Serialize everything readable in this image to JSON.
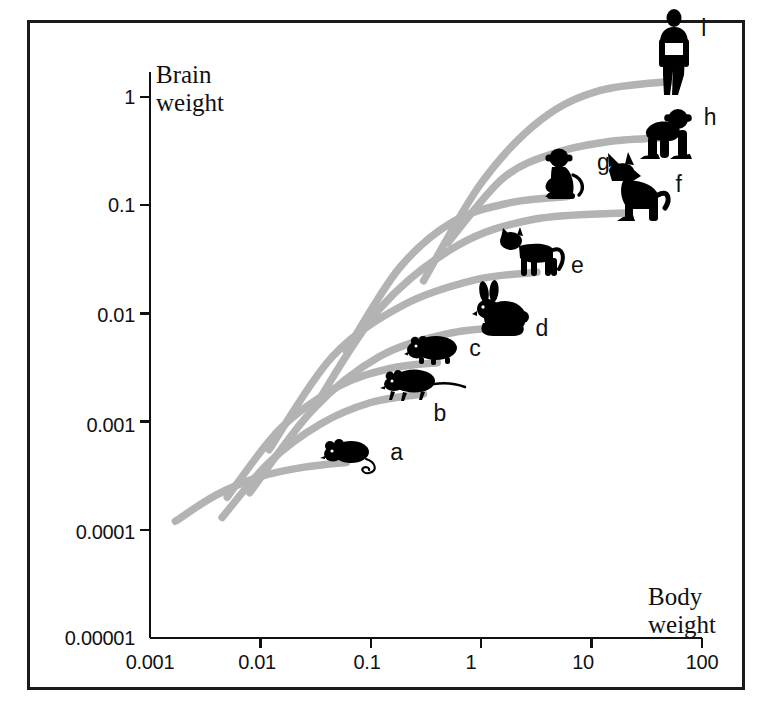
{
  "chart_data": {
    "type": "line",
    "title": "",
    "xlabel": "Body weight",
    "ylabel": "Brain weight",
    "xscale": "log",
    "yscale": "log",
    "xlim": [
      0.001,
      100
    ],
    "ylim": [
      1e-05,
      3
    ],
    "grid": false,
    "legend": "none",
    "xticks": [
      "0.001",
      "0.01",
      "0.1",
      "1",
      "10",
      "100"
    ],
    "yticks": [
      "0.00001",
      "0.0001",
      "0.001",
      "0.01",
      "0.1",
      "1"
    ],
    "annotation_note": "Each grey curve is an ontogenetic growth trajectory ending at the adult animal silhouette; labels a-i mark adult brain/body weight.",
    "series": [
      {
        "name": "a",
        "label": "a",
        "animal": "mouse",
        "adult_x": 0.06,
        "adult_y": 0.0004,
        "points": [
          {
            "x": 0.0017,
            "y": 0.00012
          },
          {
            "x": 0.004,
            "y": 0.00021
          },
          {
            "x": 0.01,
            "y": 0.00031
          },
          {
            "x": 0.025,
            "y": 0.00038
          },
          {
            "x": 0.06,
            "y": 0.00042
          }
        ]
      },
      {
        "name": "b",
        "label": "b",
        "animal": "rat",
        "adult_x": 0.3,
        "adult_y": 0.0018,
        "points": [
          {
            "x": 0.0045,
            "y": 0.00013
          },
          {
            "x": 0.012,
            "y": 0.00042
          },
          {
            "x": 0.035,
            "y": 0.00095
          },
          {
            "x": 0.1,
            "y": 0.0015
          },
          {
            "x": 0.3,
            "y": 0.0018
          }
        ]
      },
      {
        "name": "c",
        "label": "c",
        "animal": "guinea-pig",
        "adult_x": 0.4,
        "adult_y": 0.0035,
        "points": [
          {
            "x": 0.005,
            "y": 0.0002
          },
          {
            "x": 0.015,
            "y": 0.00085
          },
          {
            "x": 0.05,
            "y": 0.0021
          },
          {
            "x": 0.15,
            "y": 0.0031
          },
          {
            "x": 0.4,
            "y": 0.0035
          }
        ]
      },
      {
        "name": "d",
        "label": "d",
        "animal": "rabbit",
        "adult_x": 1.8,
        "adult_y": 0.0075,
        "points": [
          {
            "x": 0.008,
            "y": 0.00022
          },
          {
            "x": 0.03,
            "y": 0.0013
          },
          {
            "x": 0.12,
            "y": 0.004
          },
          {
            "x": 0.5,
            "y": 0.0065
          },
          {
            "x": 1.8,
            "y": 0.0075
          }
        ]
      },
      {
        "name": "e",
        "label": "e",
        "animal": "cat",
        "adult_x": 3.2,
        "adult_y": 0.024,
        "points": [
          {
            "x": 0.012,
            "y": 0.00055
          },
          {
            "x": 0.045,
            "y": 0.004
          },
          {
            "x": 0.2,
            "y": 0.012
          },
          {
            "x": 0.9,
            "y": 0.0205
          },
          {
            "x": 3.2,
            "y": 0.024
          }
        ]
      },
      {
        "name": "f",
        "label": "f",
        "animal": "dog",
        "adult_x": 22,
        "adult_y": 0.085,
        "points": [
          {
            "x": 0.03,
            "y": 0.0013
          },
          {
            "x": 0.12,
            "y": 0.011
          },
          {
            "x": 0.6,
            "y": 0.042
          },
          {
            "x": 3.0,
            "y": 0.074
          },
          {
            "x": 22.0,
            "y": 0.085
          }
        ]
      },
      {
        "name": "g",
        "label": "g",
        "animal": "monkey",
        "adult_x": 6.0,
        "adult_y": 0.12,
        "points": [
          {
            "x": 0.06,
            "y": 0.0045
          },
          {
            "x": 0.18,
            "y": 0.026
          },
          {
            "x": 0.55,
            "y": 0.07
          },
          {
            "x": 1.8,
            "y": 0.105
          },
          {
            "x": 6.0,
            "y": 0.12
          }
        ]
      },
      {
        "name": "h",
        "label": "h",
        "animal": "chimpanzee",
        "adult_x": 45,
        "adult_y": 0.42,
        "points": [
          {
            "x": 0.5,
            "y": 0.045
          },
          {
            "x": 1.6,
            "y": 0.18
          },
          {
            "x": 5.0,
            "y": 0.31
          },
          {
            "x": 15.0,
            "y": 0.39
          },
          {
            "x": 45.0,
            "y": 0.42
          }
        ]
      },
      {
        "name": "i",
        "label": "i",
        "animal": "human",
        "adult_x": 55,
        "adult_y": 1.4,
        "points": [
          {
            "x": 0.3,
            "y": 0.02
          },
          {
            "x": 1.0,
            "y": 0.16
          },
          {
            "x": 3.5,
            "y": 0.62
          },
          {
            "x": 12.0,
            "y": 1.15
          },
          {
            "x": 55.0,
            "y": 1.4
          }
        ]
      }
    ]
  },
  "axes": {
    "y_title_line1": "Brain",
    "y_title_line2": "weight",
    "x_title_line1": "Body",
    "x_title_line2": "weight"
  },
  "style": {
    "curve_color": "#b3b3b3",
    "axis_color": "#111111",
    "silhouette_color": "#000000",
    "background": "#ffffff",
    "border_color": "#1a1a1a"
  }
}
